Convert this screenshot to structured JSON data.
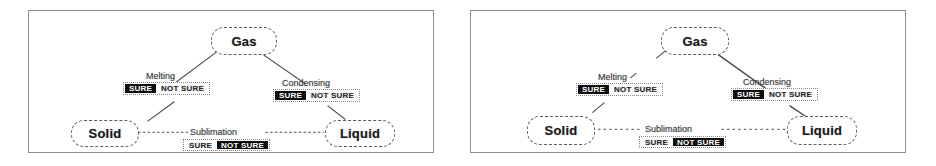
{
  "figure": {
    "kind": "states-of-matter-concept-diagram-pair",
    "panel_count": 2
  },
  "panels": [
    {
      "id": "left",
      "nodes": [
        {
          "key": "gas",
          "label": "Gas"
        },
        {
          "key": "solid",
          "label": "Solid"
        },
        {
          "key": "liquid",
          "label": "Liquid"
        }
      ],
      "transitions": [
        {
          "key": "melting",
          "label": "Melting",
          "from": "gas",
          "to": "solid",
          "connector": "solid-line",
          "options": [
            "SURE",
            "NOT SURE"
          ],
          "selected": "SURE"
        },
        {
          "key": "condensing",
          "label": "Condensing",
          "from": "gas",
          "to": "liquid",
          "connector": "solid-line",
          "options": [
            "SURE",
            "NOT SURE"
          ],
          "selected": "SURE"
        },
        {
          "key": "sublimation",
          "label": "Sublimation",
          "from": "solid",
          "to": "liquid",
          "connector": "dotted-line",
          "options": [
            "SURE",
            "NOT SURE"
          ],
          "selected": "NOT SURE"
        }
      ]
    },
    {
      "id": "right",
      "nodes": [
        {
          "key": "gas",
          "label": "Gas"
        },
        {
          "key": "solid",
          "label": "Solid"
        },
        {
          "key": "liquid",
          "label": "Liquid"
        }
      ],
      "transitions": [
        {
          "key": "melting",
          "label": "Melting",
          "from": "gas",
          "to": "solid",
          "connector": "broken-line",
          "options": [
            "SURE",
            "NOT SURE"
          ],
          "selected": "SURE"
        },
        {
          "key": "condensing",
          "label": "Condensing",
          "from": "gas",
          "to": "liquid",
          "connector": "solid-line",
          "options": [
            "SURE",
            "NOT SURE"
          ],
          "selected": "SURE"
        },
        {
          "key": "sublimation",
          "label": "Sublimation",
          "from": "solid",
          "to": "liquid",
          "connector": "dotted-line",
          "options": [
            "SURE",
            "NOT SURE"
          ],
          "selected": "NOT SURE"
        }
      ]
    }
  ],
  "colors": {
    "selected_background": "#0d0d0d",
    "selected_text": "#ffffff",
    "unselected_background": "#ffffff",
    "unselected_text": "#2c2c2c",
    "node_border": "#5d5d5d",
    "panel_border": "#8d8d8d",
    "connector": "#4a4a4a",
    "page_background": "#ffffff"
  }
}
